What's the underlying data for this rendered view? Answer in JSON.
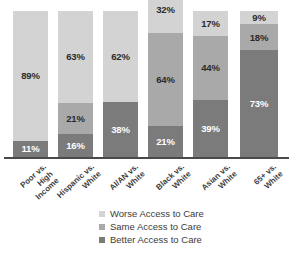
{
  "chart_data": {
    "type": "bar",
    "title": "",
    "subtitle": "",
    "xlabel": "",
    "ylabel": "",
    "stacked": true,
    "orientation": "vertical",
    "grid": false,
    "ylim": [
      0,
      100
    ],
    "legend_position": "bottom-center",
    "note": "Bars are clipped at the top edge of the image; segment percentages are printed inside each segment.",
    "categories": [
      "Poor vs. High Income",
      "Hispanic vs. White",
      "AI/AN vs. White",
      "Black vs. White",
      "Asian vs. White",
      "65+ vs. White"
    ],
    "category_lines": [
      [
        "Poor vs.",
        "High",
        "Income"
      ],
      [
        "Hispanic vs.",
        "White"
      ],
      [
        "AI/AN vs.",
        "White"
      ],
      [
        "Black vs.",
        "White"
      ],
      [
        "Asian vs.",
        "White"
      ],
      [
        "65+ vs.",
        "White"
      ]
    ],
    "series": [
      {
        "name": "Worse Access to Care",
        "color": "#d3d3d3",
        "values": [
          89,
          63,
          62,
          32,
          17,
          9
        ],
        "labels": [
          "89%",
          "63%",
          "62%",
          "32%",
          "17%",
          "9%"
        ]
      },
      {
        "name": "Same Access to Care",
        "color": "#a9a9a9",
        "values": [
          0,
          21,
          0,
          64,
          44,
          18
        ],
        "labels": [
          "",
          "21%",
          "",
          "64%",
          "44%",
          "18%"
        ]
      },
      {
        "name": "Better Access to Care",
        "color": "#7b7b7b",
        "values": [
          11,
          16,
          38,
          21,
          39,
          73
        ],
        "labels": [
          "11%",
          "16%",
          "38%",
          "21%",
          "39%",
          "73%"
        ]
      }
    ]
  },
  "legend": {
    "items": [
      {
        "label": "Worse Access to Care",
        "color": "#d3d3d3"
      },
      {
        "label": "Same Access to Care",
        "color": "#a9a9a9"
      },
      {
        "label": "Better Access to Care",
        "color": "#7b7b7b"
      }
    ]
  },
  "axis": {
    "baseline_color": "#4a4a4a"
  }
}
